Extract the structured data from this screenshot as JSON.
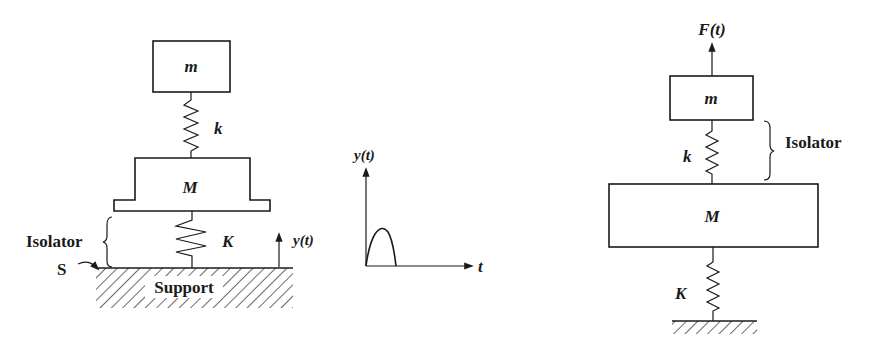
{
  "figure_left": {
    "top_mass_label": "m",
    "upper_spring_label": "k",
    "lower_mass_label": "M",
    "isolator_spring_label": "K",
    "isolator_label": "Isolator",
    "support_point_label": "S",
    "support_label": "Support",
    "excitation_label": "y(t)"
  },
  "pulse_graph": {
    "y_axis_label": "y(t)",
    "x_axis_label": "t",
    "shape": "half-sine pulse"
  },
  "figure_right": {
    "force_label": "F(t)",
    "top_mass_label": "m",
    "isolator_spring_label": "k",
    "isolator_label": "Isolator",
    "base_mass_label": "M",
    "base_spring_label": "K"
  }
}
